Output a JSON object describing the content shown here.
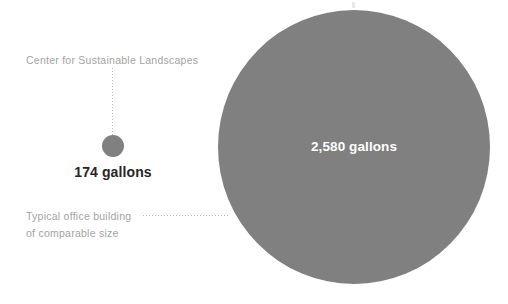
{
  "figure": {
    "type": "proportional-bubble-comparison",
    "background_color": "#ffffff",
    "bubble_color": "#808080",
    "caption_color": "#a3a3a3",
    "value_color": "#262626",
    "inside_value_color": "#ffffff",
    "leader_line_color": "#b8b8b8",
    "units": "gallons"
  },
  "chart_data": {
    "type": "bar",
    "title": "",
    "subtitle": "",
    "xlabel": "",
    "ylabel": "",
    "categories": [
      "Center for Sustainable Landscapes",
      "Typical office building of comparable size"
    ],
    "values": [
      174,
      2580
    ],
    "value_labels": [
      "174 gallons",
      "2,580 gallons"
    ],
    "unit": "gallons",
    "grid": false,
    "legend_position": "none"
  },
  "annotations": {
    "top": {
      "caption": "Center for Sustainable Landscapes",
      "value": "174 gallons"
    },
    "bottom": {
      "caption_line1": "Typical office building",
      "caption_line2": "of comparable size",
      "value": "2,580 gallons"
    }
  },
  "edge_fragment": {
    "text": "l"
  }
}
